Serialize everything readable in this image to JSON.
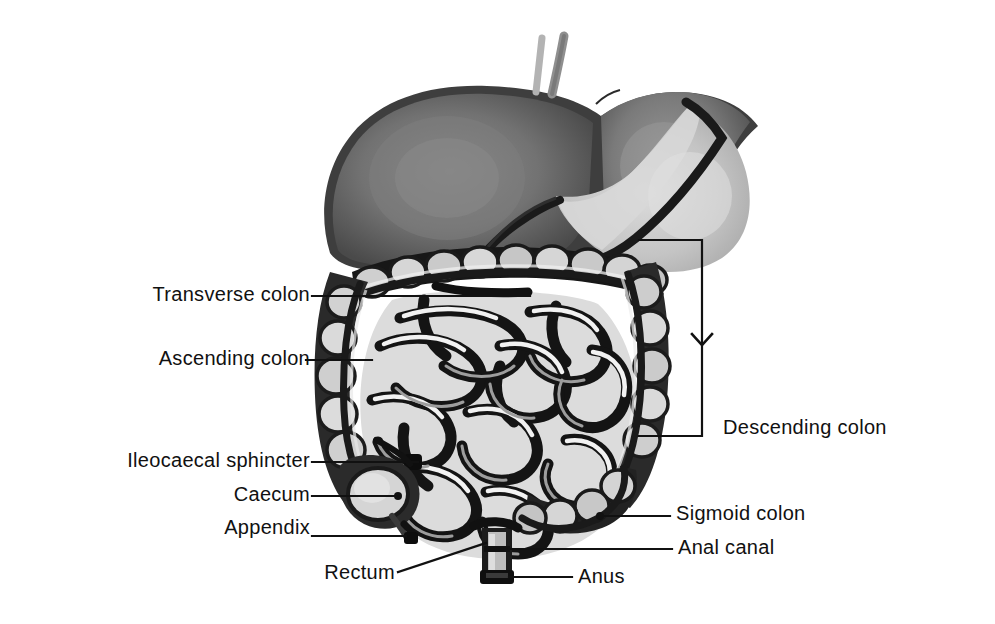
{
  "figure": {
    "background_color": "#ffffff",
    "line_color": "#111111",
    "colors": {
      "outline_dark": "#1a1a1a",
      "liver_dark": "#4f4f4f",
      "liver_mid": "#6e6e6e",
      "liver_light": "#848484",
      "stomach_light": "#c9c9c9",
      "stomach_mid": "#b0b0b0",
      "colon_fill": "#d6d6d6",
      "colon_shade": "#8f8f8f",
      "intestine_fill": "#e8e8e8",
      "intestine_shade": "#9a9a9a",
      "vessel_gray": "#9b9b9b"
    }
  },
  "labels": [
    {
      "id": "transverse-colon",
      "text": "Transverse colon",
      "align": "right",
      "x": 20,
      "y": 284,
      "width": 290
    },
    {
      "id": "ascending-colon",
      "text": "Ascending colon",
      "align": "right",
      "x": 20,
      "y": 348,
      "width": 290
    },
    {
      "id": "ileocaecal-sphincter",
      "text": "Ileocaecal sphincter",
      "align": "right",
      "x": 20,
      "y": 450,
      "width": 290
    },
    {
      "id": "caecum",
      "text": "Caecum",
      "align": "right",
      "x": 20,
      "y": 484,
      "width": 290
    },
    {
      "id": "appendix",
      "text": "Appendix",
      "align": "right",
      "x": 20,
      "y": 517,
      "width": 290
    },
    {
      "id": "rectum",
      "text": "Rectum",
      "align": "right",
      "x": 230,
      "y": 562,
      "width": 180
    },
    {
      "id": "descending-colon",
      "text": "Descending colon",
      "align": "left",
      "x": 723,
      "y": 417,
      "width": 260
    },
    {
      "id": "sigmoid-colon",
      "text": "Sigmoid colon",
      "align": "left",
      "x": 676,
      "y": 503,
      "width": 260
    },
    {
      "id": "anal-canal",
      "text": "Anal canal",
      "align": "left",
      "x": 678,
      "y": 537,
      "width": 260
    },
    {
      "id": "anus",
      "text": "Anus",
      "align": "left",
      "x": 578,
      "y": 566,
      "width": 200
    }
  ],
  "leader_lines": [
    {
      "id": "leader-transverse-colon",
      "type": "line",
      "points": "312,296 530,296"
    },
    {
      "id": "leader-ascending-colon",
      "type": "line",
      "points": "306,360 372,360"
    },
    {
      "id": "leader-ileocaecal-sphincter",
      "type": "line",
      "points": "312,462 420,462"
    },
    {
      "id": "leader-caecum",
      "type": "line",
      "points": "312,496 396,496"
    },
    {
      "id": "leader-appendix",
      "type": "line",
      "points": "312,536 408,536"
    },
    {
      "id": "leader-rectum",
      "type": "line",
      "points": "398,572 484,545"
    },
    {
      "id": "leader-descending-colon",
      "type": "bracket",
      "points": "639,240 702,240 702,436 639,436"
    },
    {
      "id": "leader-descending-colon-arrow",
      "type": "chevron",
      "points": "692,336 702,346 712,336"
    },
    {
      "id": "leader-sigmoid-colon",
      "type": "line",
      "points": "600,516 670,516"
    },
    {
      "id": "leader-anal-canal",
      "type": "line",
      "points": "509,549 672,549"
    },
    {
      "id": "leader-anus",
      "type": "line",
      "points": "509,577 572,577"
    }
  ],
  "anatomy_parts": [
    {
      "id": "liver",
      "name": "liver"
    },
    {
      "id": "stomach",
      "name": "stomach"
    },
    {
      "id": "esophagus-vessels",
      "name": "esophagus-and-vessels"
    },
    {
      "id": "transverse-colon-body",
      "name": "transverse-colon"
    },
    {
      "id": "ascending-colon-body",
      "name": "ascending-colon"
    },
    {
      "id": "descending-colon-body",
      "name": "descending-colon"
    },
    {
      "id": "small-intestine",
      "name": "small-intestine"
    },
    {
      "id": "caecum-body",
      "name": "caecum"
    },
    {
      "id": "appendix-body",
      "name": "appendix"
    },
    {
      "id": "sigmoid-colon-body",
      "name": "sigmoid-colon"
    },
    {
      "id": "rectum-body",
      "name": "rectum"
    },
    {
      "id": "anus-body",
      "name": "anus"
    }
  ]
}
